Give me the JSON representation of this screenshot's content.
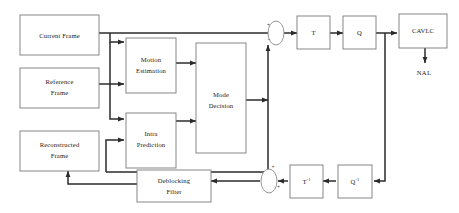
{
  "diagram": {
    "background_color": "#ffffff",
    "line_color": "#2b2b2b",
    "box_stroke_color": "#7a7a7a",
    "text_color": "#1a1a1a"
  },
  "blocks": {
    "current_frame": {
      "label_line1": "Current Frame",
      "label_line2": ""
    },
    "reference_frame": {
      "label_line1": "Reference",
      "label_line2": "Frame"
    },
    "reconstructed_frame": {
      "label_line1": "Reconstructed",
      "label_line2": "Frame"
    },
    "motion_estimation": {
      "label_line1": "Motion",
      "label_line2": "Estimation"
    },
    "intra_prediction": {
      "label_line1": "Intra",
      "label_line2": "Prediction"
    },
    "mode_decision": {
      "label_line1": "Mode",
      "label_line2": "Decision"
    },
    "transform": {
      "label_line1": "T",
      "label_line2": ""
    },
    "quantizer": {
      "label_line1": "Q",
      "label_line2": ""
    },
    "entropy_coder": {
      "label_line1": "CAVLC",
      "label_line2": ""
    },
    "inverse_transform": {
      "label_base": "T",
      "label_sup": "-1"
    },
    "inverse_quantizer": {
      "label_base": "Q",
      "label_sup": "-1"
    },
    "deblocking_filter": {
      "label_line1": "Deblocking",
      "label_line2": "Filter"
    }
  },
  "labels": {
    "nal_output": "NAL"
  },
  "signs": {
    "top_sum_plus": "+",
    "top_sum_minus": "-",
    "bottom_sum_plus": "+",
    "bottom_sum_plus_right": "+"
  }
}
